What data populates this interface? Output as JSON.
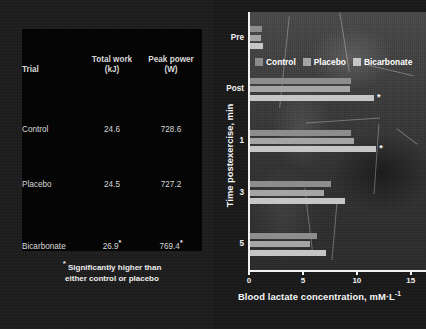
{
  "figure": {
    "background_color": "#1c1c1c"
  },
  "table": {
    "headers": {
      "trial": "Trial",
      "total_work_line1": "Total work",
      "total_work_line2": "(kJ)",
      "peak_power_line1": "Peak power",
      "peak_power_line2": "(W)"
    },
    "rows": [
      {
        "trial": "Control",
        "total_work": "24.6",
        "total_work_star": "",
        "peak_power": "728.6",
        "peak_power_star": ""
      },
      {
        "trial": "Placebo",
        "total_work": "24.5",
        "total_work_star": "",
        "peak_power": "727.2",
        "peak_power_star": ""
      },
      {
        "trial": "Bicarbonate",
        "total_work": "26.9",
        "total_work_star": "*",
        "peak_power": "769.4",
        "peak_power_star": "*"
      }
    ],
    "footnote_star": "*",
    "footnote_line1": "Significantly higher than",
    "footnote_line2": "either control or placebo"
  },
  "chart_data": {
    "type": "bar",
    "orientation": "horizontal",
    "title": "",
    "xlabel": "Blood lactate concentration, mM·L",
    "xlabel_superscript": "-1",
    "ylabel": "Time postexercise, min",
    "categories": [
      "Pre",
      "Post",
      "1",
      "3",
      "5"
    ],
    "xlim": [
      0,
      16.5
    ],
    "xticks": [
      0,
      5,
      10,
      15
    ],
    "xticklabels": [
      "0",
      "5",
      "10",
      "15"
    ],
    "grid": false,
    "legend_position": "top",
    "series": [
      {
        "name": "Control",
        "color": "#8d8d8d",
        "values": [
          1.1,
          9.4,
          9.4,
          7.5,
          6.2
        ],
        "starred": [
          false,
          false,
          false,
          false,
          false
        ]
      },
      {
        "name": "Placebo",
        "color": "#a5a5a5",
        "values": [
          1.0,
          9.3,
          9.6,
          6.9,
          5.6
        ],
        "starred": [
          false,
          false,
          false,
          false,
          false
        ]
      },
      {
        "name": "Bicarbonate",
        "color": "#c6c6c6",
        "values": [
          1.2,
          11.5,
          11.7,
          8.8,
          7.0
        ],
        "starred": [
          false,
          true,
          true,
          false,
          false
        ]
      }
    ],
    "annotations": [
      {
        "label": "*",
        "series": "Bicarbonate",
        "category": "Post"
      },
      {
        "label": "*",
        "series": "Bicarbonate",
        "category": "1"
      }
    ]
  }
}
